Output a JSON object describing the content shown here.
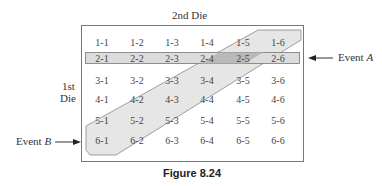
{
  "top_label": "2nd Die",
  "side_label": [
    "1st",
    "Die"
  ],
  "event_a": {
    "prefix": "Event ",
    "letter": "A"
  },
  "event_b": {
    "prefix": "Event ",
    "letter": "B"
  },
  "caption": "Figure 8.24",
  "grid": [
    [
      "1-1",
      "1-2",
      "1-3",
      "1-4",
      "1-5",
      "1-6"
    ],
    [
      "2-1",
      "2-2",
      "2-3",
      "2-4",
      "2-5",
      "2-6"
    ],
    [
      "3-1",
      "3-2",
      "3-3",
      "3-4",
      "3-5",
      "3-6"
    ],
    [
      "4-1",
      "4-2",
      "4-3",
      "4-4",
      "4-5",
      "4-6"
    ],
    [
      "5-1",
      "5-2",
      "5-3",
      "5-4",
      "5-5",
      "5-6"
    ],
    [
      "6-1",
      "6-2",
      "6-3",
      "6-4",
      "6-5",
      "6-6"
    ]
  ],
  "colors": {
    "band_fill": "#e3e3e3",
    "overlap_fill": "#bdbdbd",
    "border": "#7a7a7a"
  }
}
